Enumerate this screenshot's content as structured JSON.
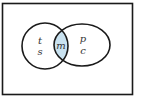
{
  "diagram": {
    "type": "venn",
    "universe": {
      "label": ""
    },
    "sets": [
      {
        "name": "left-set",
        "elements": [
          "t",
          "s"
        ]
      },
      {
        "name": "right-set",
        "elements": [
          "p",
          "c"
        ]
      }
    ],
    "intersection": {
      "elements": [
        "m"
      ],
      "fill": "#c9e2f0"
    },
    "labels": {
      "left_top": "t",
      "left_bottom": "s",
      "intersection": "m",
      "right_top": "p",
      "right_bottom": "c"
    },
    "colors": {
      "stroke": "#1a1a1a",
      "intersection_fill": "#c9e2f0",
      "background": "#ffffff"
    }
  }
}
